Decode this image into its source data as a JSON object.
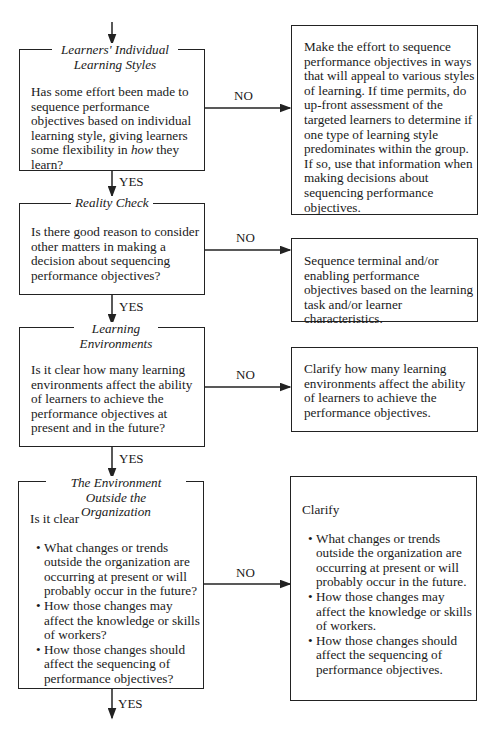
{
  "flowchart": {
    "decisions": [
      {
        "title": "Learners' Individual Learning Styles",
        "title_lines": [
          "Learners' Individual",
          "Learning Styles"
        ],
        "question_pre": "Has some effort been made to sequence performance objectives based on individual learning style, giving learners some flexibility in ",
        "question_em": "how",
        "question_post": " they learn?",
        "no_label": "NO",
        "yes_label": "YES",
        "action": "Make the effort to sequence performance objectives in ways that will appeal to various styles of learning. If time permits, do up-front assessment of the targeted learners to determine if one type of learning style predominates within the group. If so, use that information when making decisions about sequencing performance objectives."
      },
      {
        "title": "Reality Check",
        "question": "Is there good reason to consider other matters in making a decision about sequencing performance objectives?",
        "no_label": "NO",
        "yes_label": "YES",
        "action": "Sequence terminal and/or enabling performance objectives based on the learning task and/or learner characteristics."
      },
      {
        "title": "Learning Environments",
        "title_lines": [
          "Learning",
          "Environments"
        ],
        "question": "Is it clear how many learning environments affect the ability of learners to achieve the performance objectives at present and in the future?",
        "no_label": "NO",
        "yes_label": "YES",
        "action": "Clarify how many learning environments affect the ability of learners to achieve the performance objectives."
      },
      {
        "title": "The Environment Outside the Organization",
        "title_lines": [
          "The Environment",
          "Outside the Organization"
        ],
        "question_intro": "Is it clear",
        "question_bullets": [
          "What changes or trends outside the organization are occurring at present or will probably occur in the future?",
          "How those changes may affect the knowledge or skills of workers?",
          "How those changes should affect the sequencing of performance objectives?"
        ],
        "no_label": "NO",
        "yes_label": "YES",
        "action_intro": "Clarify",
        "action_bullets": [
          "What changes or trends outside the organization are occurring at present or will probably occur in the future.",
          "How those changes may affect the knowledge or skills of workers.",
          "How those changes should affect the sequencing of performance objectives."
        ]
      }
    ]
  }
}
